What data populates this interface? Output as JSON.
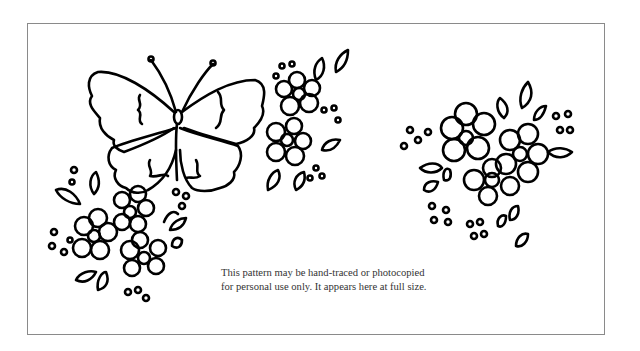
{
  "page": {
    "caption": {
      "line1": "This pattern may be hand-traced or photocopied",
      "line2": "for personal use only. It appears here at full size."
    },
    "illustrations": [
      "butterfly",
      "flower-cluster-top-center",
      "flower-cluster-bottom-left",
      "flower-cluster-right"
    ],
    "colors": {
      "background": "#ffffff",
      "frame_border": "#8a8a8a",
      "line_art": "#000000",
      "caption_text": "#333333"
    }
  }
}
